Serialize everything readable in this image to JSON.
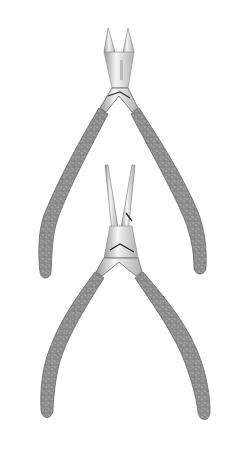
{
  "image": {
    "description": "Product photo of two stainless steel manicure tools with glitter-gray handles on white background",
    "background": "#ffffff",
    "items": [
      {
        "name": "cuticle-nipper",
        "position": "top",
        "jaw_type": "pointed cutting jaws",
        "handle_color": "#8a8a8a"
      },
      {
        "name": "flat-nose-pliers",
        "position": "bottom",
        "jaw_type": "long narrow jaws",
        "handle_color": "#8a8a8a"
      }
    ],
    "colors": {
      "steel_light": "#f2f2f2",
      "steel_mid": "#c8c8c8",
      "steel_dark": "#555555",
      "handle": "#8c8c8c",
      "handle_dark": "#6e6e6e",
      "speckle": "#d9d9d9"
    }
  }
}
